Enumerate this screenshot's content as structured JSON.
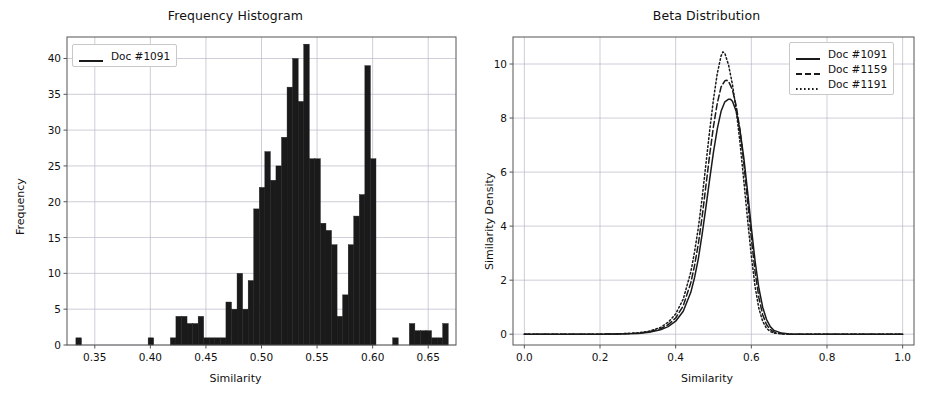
{
  "figure": {
    "width": 943,
    "height": 399,
    "background": "#ffffff",
    "line_color": "#1a1a1a",
    "grid_color": "#b8b8c8",
    "axis_color": "#555555"
  },
  "panels": [
    {
      "id": "frequency-histogram",
      "title": "Frequency Histogram",
      "xlabel": "Similarity",
      "ylabel": "Frequency",
      "xticks": [
        "0.35",
        "0.40",
        "0.45",
        "0.50",
        "0.55",
        "0.60",
        "0.65"
      ],
      "yticks": [
        "0",
        "5",
        "10",
        "15",
        "20",
        "25",
        "30",
        "35",
        "40"
      ],
      "legend": [
        {
          "label": "Doc #1091",
          "style": "solid"
        }
      ]
    },
    {
      "id": "beta-distribution",
      "title": "Beta Distribution",
      "xlabel": "Similarity",
      "ylabel": "Similarity Density",
      "xticks": [
        "0.0",
        "0.2",
        "0.4",
        "0.6",
        "0.8",
        "1.0"
      ],
      "yticks": [
        "0",
        "2",
        "4",
        "6",
        "8",
        "10"
      ],
      "legend": [
        {
          "label": "Doc #1091",
          "style": "solid"
        },
        {
          "label": "Doc #1159",
          "style": "dashed"
        },
        {
          "label": "Doc #1191",
          "style": "dotted"
        }
      ]
    }
  ],
  "chart_data": [
    {
      "type": "bar",
      "subtype": "histogram",
      "title": "Frequency Histogram",
      "xlabel": "Similarity",
      "ylabel": "Frequency",
      "xlim": [
        0.325,
        0.675
      ],
      "ylim": [
        0,
        43
      ],
      "xticks": [
        0.35,
        0.4,
        0.45,
        0.5,
        0.55,
        0.6,
        0.65
      ],
      "yticks": [
        0,
        5,
        10,
        15,
        20,
        25,
        30,
        35,
        40
      ],
      "grid": true,
      "legend_position": "upper left",
      "bin_width": 0.005,
      "series": [
        {
          "name": "Doc #1091",
          "bin_starts": [
            0.333,
            0.338,
            0.343,
            0.348,
            0.353,
            0.358,
            0.363,
            0.368,
            0.373,
            0.378,
            0.383,
            0.388,
            0.393,
            0.398,
            0.403,
            0.408,
            0.413,
            0.418,
            0.423,
            0.428,
            0.433,
            0.438,
            0.443,
            0.448,
            0.453,
            0.458,
            0.463,
            0.468,
            0.473,
            0.478,
            0.483,
            0.488,
            0.493,
            0.498,
            0.503,
            0.508,
            0.513,
            0.518,
            0.523,
            0.528,
            0.533,
            0.538,
            0.543,
            0.548,
            0.553,
            0.558,
            0.563,
            0.568,
            0.573,
            0.578,
            0.583,
            0.588,
            0.593,
            0.598,
            0.603,
            0.608,
            0.613,
            0.618,
            0.623,
            0.628,
            0.633,
            0.638,
            0.643,
            0.648,
            0.653,
            0.658,
            0.663
          ],
          "values": [
            1,
            0,
            0,
            0,
            0,
            0,
            0,
            0,
            0,
            0,
            0,
            0,
            0,
            1,
            0,
            0,
            0,
            1,
            4,
            4,
            3,
            3,
            4,
            1,
            1,
            1,
            1,
            6,
            5,
            10,
            5,
            9,
            19,
            22,
            27,
            23,
            25,
            29,
            36,
            40,
            34,
            42,
            26,
            26,
            17,
            16,
            14,
            4,
            7,
            14,
            18,
            21,
            39,
            26,
            0,
            0,
            0,
            1,
            0,
            0,
            3,
            2,
            2,
            2,
            1,
            1,
            3
          ]
        }
      ]
    },
    {
      "type": "line",
      "title": "Beta Distribution",
      "xlabel": "Similarity",
      "ylabel": "Similarity Density",
      "xlim": [
        -0.03,
        1.03
      ],
      "ylim": [
        -0.4,
        11.0
      ],
      "xticks": [
        0.0,
        0.2,
        0.4,
        0.6,
        0.8,
        1.0
      ],
      "yticks": [
        0,
        2,
        4,
        6,
        8,
        10
      ],
      "grid": true,
      "legend_position": "upper right",
      "series": [
        {
          "name": "Doc #1091",
          "style": "solid",
          "peak_x": 0.545,
          "peak_y": 8.7,
          "x": [
            0.0,
            0.05,
            0.1,
            0.15,
            0.2,
            0.25,
            0.3,
            0.33,
            0.36,
            0.38,
            0.4,
            0.42,
            0.44,
            0.45,
            0.46,
            0.47,
            0.48,
            0.49,
            0.5,
            0.51,
            0.52,
            0.53,
            0.54,
            0.545,
            0.55,
            0.56,
            0.57,
            0.58,
            0.59,
            0.6,
            0.61,
            0.62,
            0.63,
            0.64,
            0.65,
            0.66,
            0.68,
            0.7,
            0.75,
            0.8,
            0.9,
            1.0
          ],
          "y": [
            0.0,
            0.0,
            0.0,
            0.0,
            0.0,
            0.01,
            0.03,
            0.07,
            0.16,
            0.28,
            0.48,
            0.85,
            1.55,
            2.1,
            2.8,
            3.7,
            4.7,
            5.75,
            6.75,
            7.6,
            8.25,
            8.6,
            8.7,
            8.7,
            8.62,
            8.25,
            7.55,
            6.55,
            5.3,
            3.95,
            2.7,
            1.7,
            1.0,
            0.55,
            0.28,
            0.14,
            0.04,
            0.01,
            0.0,
            0.0,
            0.0,
            0.0
          ]
        },
        {
          "name": "Doc #1159",
          "style": "dashed",
          "peak_x": 0.535,
          "peak_y": 9.4,
          "x": [
            0.0,
            0.05,
            0.1,
            0.15,
            0.2,
            0.25,
            0.3,
            0.33,
            0.36,
            0.38,
            0.4,
            0.42,
            0.44,
            0.45,
            0.46,
            0.47,
            0.48,
            0.49,
            0.5,
            0.51,
            0.52,
            0.53,
            0.535,
            0.54,
            0.55,
            0.56,
            0.57,
            0.58,
            0.59,
            0.6,
            0.61,
            0.62,
            0.63,
            0.64,
            0.65,
            0.66,
            0.68,
            0.7,
            0.75,
            0.8,
            0.9,
            1.0
          ],
          "y": [
            0.0,
            0.0,
            0.0,
            0.0,
            0.0,
            0.01,
            0.04,
            0.09,
            0.2,
            0.35,
            0.6,
            1.05,
            1.9,
            2.55,
            3.35,
            4.35,
            5.5,
            6.65,
            7.7,
            8.55,
            9.15,
            9.38,
            9.4,
            9.35,
            9.05,
            8.45,
            7.55,
            6.35,
            4.95,
            3.55,
            2.3,
            1.35,
            0.72,
            0.36,
            0.17,
            0.08,
            0.02,
            0.0,
            0.0,
            0.0,
            0.0,
            0.0
          ]
        },
        {
          "name": "Doc #1191",
          "style": "dotted",
          "peak_x": 0.525,
          "peak_y": 10.45,
          "x": [
            0.0,
            0.05,
            0.1,
            0.15,
            0.2,
            0.25,
            0.3,
            0.33,
            0.36,
            0.38,
            0.4,
            0.42,
            0.44,
            0.45,
            0.46,
            0.47,
            0.48,
            0.49,
            0.5,
            0.51,
            0.52,
            0.525,
            0.53,
            0.54,
            0.55,
            0.56,
            0.57,
            0.58,
            0.59,
            0.6,
            0.61,
            0.62,
            0.63,
            0.64,
            0.65,
            0.66,
            0.68,
            0.7,
            0.75,
            0.8,
            0.9,
            1.0
          ],
          "y": [
            0.0,
            0.0,
            0.0,
            0.0,
            0.0,
            0.01,
            0.05,
            0.11,
            0.25,
            0.44,
            0.75,
            1.3,
            2.3,
            3.05,
            3.95,
            5.05,
            6.3,
            7.55,
            8.7,
            9.65,
            10.3,
            10.45,
            10.4,
            9.95,
            9.25,
            8.3,
            7.1,
            5.7,
            4.25,
            2.9,
            1.75,
            0.95,
            0.48,
            0.22,
            0.1,
            0.04,
            0.01,
            0.0,
            0.0,
            0.0,
            0.0,
            0.0
          ]
        }
      ]
    }
  ]
}
